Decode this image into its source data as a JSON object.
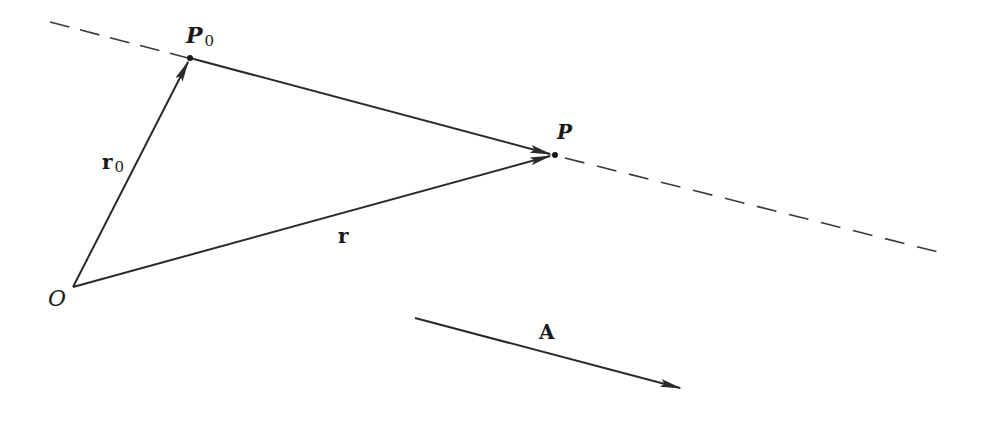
{
  "diagram": {
    "title": "",
    "stroke_color": "#2a2a2a",
    "points": {
      "O": {
        "label": "O",
        "x": 73,
        "y": 287
      },
      "P0": {
        "label": "P",
        "subscript": "0",
        "x": 190,
        "y": 58
      },
      "P": {
        "label": "P",
        "x": 555,
        "y": 155
      }
    },
    "vectors": {
      "r0": {
        "label": "r",
        "subscript": "0",
        "from": "O",
        "to": "P0"
      },
      "r": {
        "label": "r",
        "from": "O",
        "to": "P"
      },
      "P0P": {
        "label": "",
        "from": "P0",
        "to": "P"
      },
      "A": {
        "label": "A",
        "from": [
          415,
          318
        ],
        "to": [
          680,
          388
        ]
      }
    },
    "line": {
      "style": "dashed",
      "from": [
        50,
        22
      ],
      "to": [
        938,
        252
      ],
      "through": [
        "P0",
        "P"
      ]
    }
  }
}
